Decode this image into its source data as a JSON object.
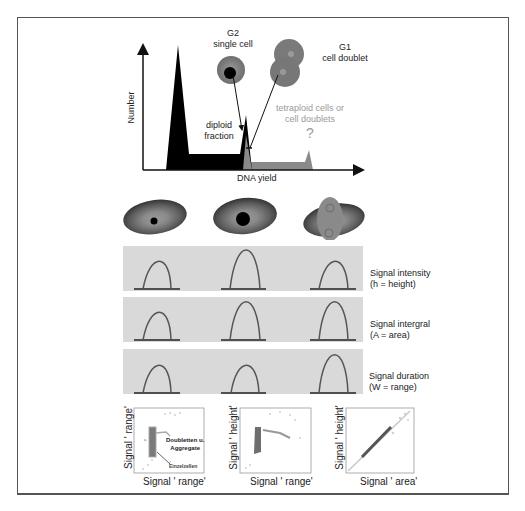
{
  "histogram": {
    "y_label": "Number",
    "x_label": "DNA yield",
    "g2_title_line1": "G2",
    "g2_title_line2": "single cell",
    "g1_title_line1": "G1",
    "g1_title_line2": "cell doublet",
    "diploid_line1": "diploid",
    "diploid_line2": "fraction",
    "tetraploid_line1": "tetraploid cells or",
    "tetraploid_line2": "cell doublets",
    "question_mark": "?"
  },
  "cells": [
    {
      "name": "G1 single cell",
      "nucleus": "small"
    },
    {
      "name": "G2 single cell",
      "nucleus": "large"
    },
    {
      "name": "G1 cell doublet",
      "nucleus": "double"
    }
  ],
  "signal_panels": [
    {
      "label_line1": "Signal intensity",
      "label_line2": "(h = height)",
      "peaks": [
        {
          "height": 30,
          "width": 28
        },
        {
          "height": 42,
          "width": 28
        },
        {
          "height": 30,
          "width": 28
        }
      ]
    },
    {
      "label_line1": "Signal intergral",
      "label_line2": "(A = area)",
      "peaks": [
        {
          "height": 30,
          "width": 28
        },
        {
          "height": 42,
          "width": 28
        },
        {
          "height": 42,
          "width": 28
        }
      ]
    },
    {
      "label_line1": "Signal duration",
      "label_line2": "(W = range)",
      "peaks": [
        {
          "height": 30,
          "width": 28
        },
        {
          "height": 30,
          "width": 28
        },
        {
          "height": 42,
          "width": 28
        }
      ]
    }
  ],
  "scatter_plots": [
    {
      "y_label": "Signal ' range'",
      "x_label": "Signal ' range'",
      "tick_max": "1023",
      "tick_min": "0",
      "annotation_1": "Doubletten u.",
      "annotation_2": "Aggregate",
      "annotation_3": "Einzelzellen"
    },
    {
      "y_label": "Signal ' height'",
      "x_label": "Signal ' range'",
      "tick_max": "1023",
      "tick_min": "0"
    },
    {
      "y_label": "Signal ' height'",
      "x_label": "Signal ' area'",
      "tick_max": "1023",
      "tick_min": "0"
    }
  ],
  "colors": {
    "frame": "#555555",
    "panel_bg": "#d9d9d9",
    "peak_stroke": "#5a5a5a",
    "histogram_black": "#000000",
    "histogram_gray": "#8a8a8a",
    "annotation_gray": "#9a9a9a"
  }
}
